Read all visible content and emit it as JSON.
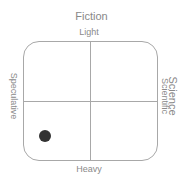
{
  "axes": {
    "vertical_title": "Fiction",
    "top_label": "Light",
    "bottom_label": "Heavy",
    "left_label": "Speculative",
    "right_title": "Science",
    "right_label": "Scientific"
  },
  "colors": {
    "line": "#a8a8a8",
    "text": "#8a8a8a",
    "marker": "#333333"
  },
  "markers": [
    {
      "name": "point",
      "x_pct": 16,
      "y_pct": 80,
      "radius": 6,
      "color": "#333333"
    }
  ]
}
